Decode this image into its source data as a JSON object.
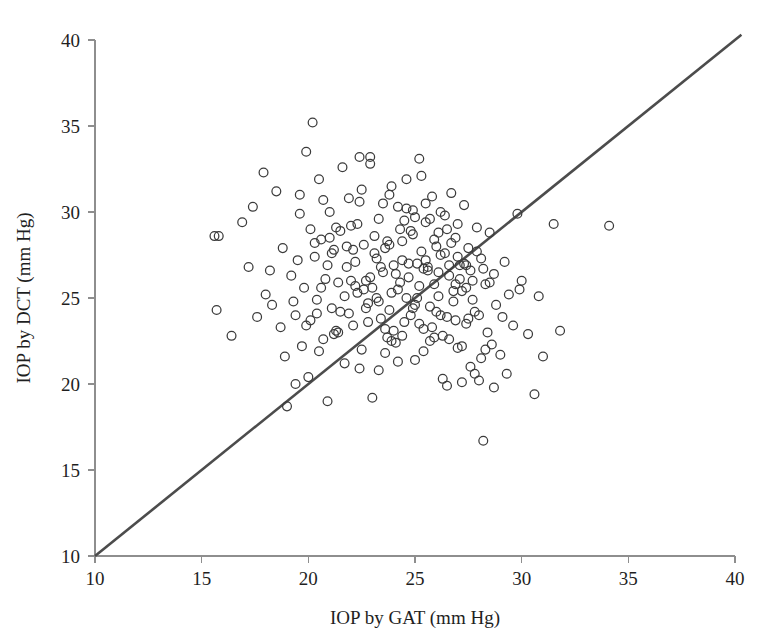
{
  "chart_data": {
    "type": "scatter",
    "title": "",
    "xlabel": "IOP by GAT (mm Hg)",
    "ylabel": "IOP by DCT (mm Hg)",
    "xlim": [
      10,
      40
    ],
    "ylim": [
      10,
      40
    ],
    "xticks": [
      10,
      15,
      20,
      25,
      30,
      35,
      40
    ],
    "yticks": [
      10,
      15,
      20,
      25,
      30,
      35,
      40
    ],
    "xtick_labels": [
      "10",
      "15",
      "20",
      "25",
      "30",
      "35",
      "40"
    ],
    "ytick_labels": [
      "10",
      "15",
      "20",
      "25",
      "30",
      "35",
      "40"
    ],
    "grid": false,
    "legend": null,
    "legend_position": "none",
    "marker": "open-circle",
    "marker_color": "#3b3b3b",
    "marker_radius_px": 4.4,
    "reference_line": {
      "name": "identity-line",
      "type": "line",
      "equation": "y = x",
      "from": [
        10,
        10
      ],
      "to": [
        40.3,
        40.3
      ],
      "color": "#4c4c4c",
      "width_px": 2.6
    },
    "n_points": 251,
    "points": [
      [
        15.6,
        28.6
      ],
      [
        15.8,
        28.6
      ],
      [
        15.7,
        24.3
      ],
      [
        16.4,
        22.8
      ],
      [
        16.9,
        29.4
      ],
      [
        17.2,
        26.8
      ],
      [
        17.4,
        30.3
      ],
      [
        17.6,
        23.9
      ],
      [
        17.9,
        32.3
      ],
      [
        18.0,
        25.2
      ],
      [
        18.2,
        26.6
      ],
      [
        18.3,
        24.6
      ],
      [
        18.5,
        31.2
      ],
      [
        18.7,
        23.3
      ],
      [
        18.9,
        21.6
      ],
      [
        19.0,
        18.7
      ],
      [
        19.2,
        26.3
      ],
      [
        19.4,
        24.0
      ],
      [
        19.5,
        27.2
      ],
      [
        19.6,
        29.9
      ],
      [
        19.7,
        22.2
      ],
      [
        19.8,
        25.6
      ],
      [
        19.9,
        33.5
      ],
      [
        20.0,
        20.4
      ],
      [
        20.1,
        23.7
      ],
      [
        20.2,
        35.2
      ],
      [
        20.3,
        27.4
      ],
      [
        20.4,
        24.9
      ],
      [
        20.5,
        31.9
      ],
      [
        20.6,
        28.4
      ],
      [
        20.7,
        22.6
      ],
      [
        20.8,
        26.1
      ],
      [
        20.9,
        19.0
      ],
      [
        21.0,
        30.0
      ],
      [
        21.1,
        24.4
      ],
      [
        21.2,
        27.8
      ],
      [
        21.3,
        23.1
      ],
      [
        21.4,
        25.9
      ],
      [
        21.5,
        28.9
      ],
      [
        21.6,
        32.6
      ],
      [
        21.7,
        21.2
      ],
      [
        21.8,
        26.8
      ],
      [
        21.9,
        24.1
      ],
      [
        22.0,
        29.2
      ],
      [
        22.1,
        23.4
      ],
      [
        22.2,
        27.1
      ],
      [
        22.3,
        25.3
      ],
      [
        22.4,
        30.6
      ],
      [
        22.5,
        22.0
      ],
      [
        22.6,
        28.1
      ],
      [
        22.7,
        26.0
      ],
      [
        22.8,
        24.7
      ],
      [
        22.9,
        33.2
      ],
      [
        23.0,
        19.2
      ],
      [
        23.1,
        27.6
      ],
      [
        23.2,
        25.0
      ],
      [
        23.3,
        29.6
      ],
      [
        23.4,
        23.8
      ],
      [
        23.5,
        26.5
      ],
      [
        23.6,
        21.8
      ],
      [
        23.7,
        28.3
      ],
      [
        23.8,
        24.3
      ],
      [
        23.9,
        31.5
      ],
      [
        24.0,
        26.9
      ],
      [
        24.1,
        22.4
      ],
      [
        24.2,
        25.5
      ],
      [
        24.3,
        29.0
      ],
      [
        24.4,
        27.2
      ],
      [
        24.5,
        23.6
      ],
      [
        24.6,
        30.2
      ],
      [
        24.7,
        26.2
      ],
      [
        24.8,
        24.0
      ],
      [
        24.9,
        28.7
      ],
      [
        25.0,
        21.4
      ],
      [
        25.1,
        27.0
      ],
      [
        25.2,
        25.7
      ],
      [
        25.3,
        32.1
      ],
      [
        25.4,
        23.2
      ],
      [
        25.5,
        29.4
      ],
      [
        25.6,
        26.6
      ],
      [
        25.7,
        24.5
      ],
      [
        25.8,
        30.9
      ],
      [
        25.9,
        22.7
      ],
      [
        26.0,
        28.0
      ],
      [
        26.1,
        25.1
      ],
      [
        26.2,
        27.5
      ],
      [
        26.3,
        20.3
      ],
      [
        26.4,
        29.8
      ],
      [
        26.5,
        23.9
      ],
      [
        26.6,
        26.3
      ],
      [
        26.7,
        31.1
      ],
      [
        26.8,
        24.8
      ],
      [
        26.9,
        28.5
      ],
      [
        27.0,
        22.1
      ],
      [
        27.1,
        26.9
      ],
      [
        27.2,
        25.4
      ],
      [
        27.3,
        30.4
      ],
      [
        27.4,
        23.5
      ],
      [
        27.5,
        27.9
      ],
      [
        27.6,
        21.0
      ],
      [
        27.7,
        26.0
      ],
      [
        27.8,
        24.2
      ],
      [
        27.9,
        29.1
      ],
      [
        28.0,
        20.2
      ],
      [
        28.1,
        27.3
      ],
      [
        28.2,
        16.7
      ],
      [
        28.3,
        25.8
      ],
      [
        28.4,
        23.0
      ],
      [
        28.5,
        28.8
      ],
      [
        28.6,
        22.3
      ],
      [
        28.7,
        26.4
      ],
      [
        28.8,
        24.6
      ],
      [
        29.0,
        21.7
      ],
      [
        29.2,
        27.1
      ],
      [
        29.4,
        25.2
      ],
      [
        29.6,
        23.4
      ],
      [
        29.8,
        29.9
      ],
      [
        30.0,
        26.0
      ],
      [
        30.3,
        22.9
      ],
      [
        30.6,
        19.4
      ],
      [
        31.0,
        21.6
      ],
      [
        31.5,
        29.3
      ],
      [
        31.8,
        23.1
      ],
      [
        34.1,
        29.2
      ],
      [
        19.4,
        20.0
      ],
      [
        20.1,
        29.0
      ],
      [
        20.6,
        25.6
      ],
      [
        21.2,
        22.9
      ],
      [
        21.9,
        30.8
      ],
      [
        22.4,
        20.9
      ],
      [
        22.9,
        26.2
      ],
      [
        23.3,
        24.8
      ],
      [
        23.8,
        28.1
      ],
      [
        24.2,
        21.3
      ],
      [
        24.6,
        25.0
      ],
      [
        25.0,
        29.7
      ],
      [
        25.4,
        26.7
      ],
      [
        25.8,
        23.3
      ],
      [
        26.2,
        30.0
      ],
      [
        26.6,
        22.6
      ],
      [
        27.0,
        27.4
      ],
      [
        27.4,
        25.6
      ],
      [
        27.8,
        20.6
      ],
      [
        28.2,
        26.7
      ],
      [
        18.8,
        27.9
      ],
      [
        19.6,
        31.0
      ],
      [
        20.4,
        24.1
      ],
      [
        21.1,
        27.6
      ],
      [
        21.7,
        25.1
      ],
      [
        22.3,
        29.3
      ],
      [
        22.8,
        23.6
      ],
      [
        23.4,
        26.8
      ],
      [
        23.9,
        25.3
      ],
      [
        24.4,
        28.3
      ],
      [
        24.9,
        24.4
      ],
      [
        25.3,
        27.7
      ],
      [
        25.7,
        22.5
      ],
      [
        26.1,
        26.5
      ],
      [
        26.5,
        29.0
      ],
      [
        26.9,
        23.7
      ],
      [
        27.3,
        27.0
      ],
      [
        27.7,
        24.9
      ],
      [
        28.1,
        21.5
      ],
      [
        28.5,
        25.9
      ],
      [
        20.9,
        26.9
      ],
      [
        21.5,
        24.2
      ],
      [
        22.1,
        27.8
      ],
      [
        22.6,
        25.5
      ],
      [
        23.1,
        28.6
      ],
      [
        23.6,
        23.2
      ],
      [
        24.1,
        26.4
      ],
      [
        24.5,
        29.5
      ],
      [
        25.0,
        24.6
      ],
      [
        25.5,
        27.2
      ],
      [
        25.9,
        25.8
      ],
      [
        26.3,
        22.8
      ],
      [
        26.7,
        28.2
      ],
      [
        27.1,
        26.1
      ],
      [
        27.5,
        23.8
      ],
      [
        21.3,
        29.1
      ],
      [
        22.0,
        26.0
      ],
      [
        22.7,
        24.4
      ],
      [
        23.2,
        27.3
      ],
      [
        23.7,
        22.7
      ],
      [
        24.3,
        25.9
      ],
      [
        24.8,
        28.9
      ],
      [
        25.2,
        23.5
      ],
      [
        25.6,
        26.8
      ],
      [
        26.0,
        24.2
      ],
      [
        26.4,
        27.6
      ],
      [
        26.8,
        25.4
      ],
      [
        27.2,
        22.2
      ],
      [
        27.6,
        26.6
      ],
      [
        28.0,
        24.0
      ],
      [
        22.5,
        31.3
      ],
      [
        23.0,
        25.6
      ],
      [
        23.5,
        30.5
      ],
      [
        24.0,
        23.1
      ],
      [
        24.7,
        27.0
      ],
      [
        25.1,
        25.0
      ],
      [
        25.9,
        28.4
      ],
      [
        26.9,
        25.8
      ],
      [
        20.3,
        28.2
      ],
      [
        21.8,
        28.0
      ],
      [
        23.9,
        22.5
      ],
      [
        24.9,
        30.1
      ],
      [
        26.2,
        24.0
      ],
      [
        27.0,
        29.3
      ],
      [
        19.9,
        23.4
      ],
      [
        22.2,
        25.7
      ],
      [
        23.6,
        27.9
      ],
      [
        25.4,
        21.9
      ],
      [
        26.6,
        26.9
      ],
      [
        28.3,
        22.0
      ],
      [
        20.7,
        30.7
      ],
      [
        21.4,
        23.0
      ],
      [
        22.9,
        32.8
      ],
      [
        24.4,
        22.8
      ],
      [
        25.7,
        29.6
      ],
      [
        27.2,
        20.1
      ],
      [
        29.1,
        23.9
      ],
      [
        29.9,
        25.5
      ],
      [
        19.3,
        24.8
      ],
      [
        20.5,
        21.9
      ],
      [
        21.0,
        28.5
      ],
      [
        23.3,
        20.8
      ],
      [
        24.6,
        31.9
      ],
      [
        26.5,
        19.9
      ],
      [
        27.9,
        27.7
      ],
      [
        22.4,
        33.2
      ],
      [
        25.2,
        33.1
      ],
      [
        23.8,
        31.0
      ],
      [
        25.5,
        30.5
      ],
      [
        24.2,
        30.3
      ],
      [
        26.1,
        28.8
      ],
      [
        27.4,
        26.9
      ],
      [
        28.7,
        19.8
      ],
      [
        29.3,
        20.6
      ],
      [
        30.8,
        25.1
      ]
    ]
  }
}
